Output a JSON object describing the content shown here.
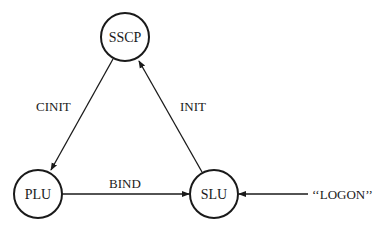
{
  "diagram": {
    "colors": {
      "stroke": "#1a1a1a",
      "background": "#ffffff"
    },
    "nodes": [
      {
        "id": "sscp",
        "label": "SSCP",
        "cx": 125,
        "cy": 37,
        "r": 24
      },
      {
        "id": "plu",
        "label": "PLU",
        "cx": 38,
        "cy": 194,
        "r": 24
      },
      {
        "id": "slu",
        "label": "SLU",
        "cx": 214,
        "cy": 194,
        "r": 24
      }
    ],
    "edges": [
      {
        "id": "cinit",
        "label": "CINIT",
        "from": "SSCP",
        "to": "PLU"
      },
      {
        "id": "init",
        "label": "INIT",
        "from": "SLU",
        "to": "SSCP"
      },
      {
        "id": "bind",
        "label": "BIND",
        "from": "PLU",
        "to": "SLU"
      },
      {
        "id": "logon",
        "label": "‘‘LOGON’’",
        "from": "external",
        "to": "SLU"
      }
    ]
  }
}
